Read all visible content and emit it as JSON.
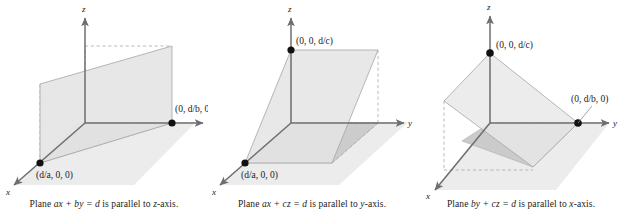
{
  "figure": {
    "type": "three-panel-3d-plane-diagram",
    "background": "#ffffff",
    "panels": [
      {
        "id": "panel-1",
        "caption_parts": {
          "lead": "Plane ",
          "equation": "ax + by = d",
          "mid": " is parallel to ",
          "axis": "z",
          "tail": "-axis."
        },
        "caption_full": "Plane ax + by = d is parallel to z-axis.",
        "axes": {
          "x": "x",
          "y": "y",
          "z": "z"
        },
        "points": [
          {
            "name": "y-intercept",
            "label": "(0, d/b, 0)",
            "clipped": true
          },
          {
            "name": "x-intercept",
            "label": "(d/a, 0, 0)",
            "clipped": false
          }
        ]
      },
      {
        "id": "panel-2",
        "caption_parts": {
          "lead": "Plane ",
          "equation": "ax + cz = d",
          "mid": " is parallel to ",
          "axis": "y",
          "tail": "-axis."
        },
        "caption_full": "Plane ax + cz = d is parallel to y-axis.",
        "axes": {
          "x": "x",
          "y": "y",
          "z": "z"
        },
        "points": [
          {
            "name": "z-intercept",
            "label": "(0, 0, d/c)",
            "clipped": false
          },
          {
            "name": "x-intercept",
            "label": "(d/a, 0, 0)",
            "clipped": false
          }
        ]
      },
      {
        "id": "panel-3",
        "caption_parts": {
          "lead": "Plane ",
          "equation": "by + cz = d",
          "mid": " is parallel to ",
          "axis": "x",
          "tail": "-axis."
        },
        "caption_full": "Plane by + cz = d is parallel to x-axis.",
        "axes": {
          "x": "x",
          "y": "y",
          "z": "z"
        },
        "points": [
          {
            "name": "z-intercept",
            "label": "(0, 0, d/c)",
            "clipped": false
          },
          {
            "name": "y-intercept",
            "label": "(0, d/b, 0)",
            "clipped": false
          }
        ]
      }
    ],
    "colors": {
      "axis": "#6e6e6e",
      "plane_fill": "#e9e9e9",
      "plane_edge": "#9a9a9a",
      "ground_fill": "#ececec",
      "ground_shade": "#cfcfcf",
      "dashed": "#a8a8a8",
      "dot": "#111111",
      "text": "#1a1a1a"
    }
  }
}
